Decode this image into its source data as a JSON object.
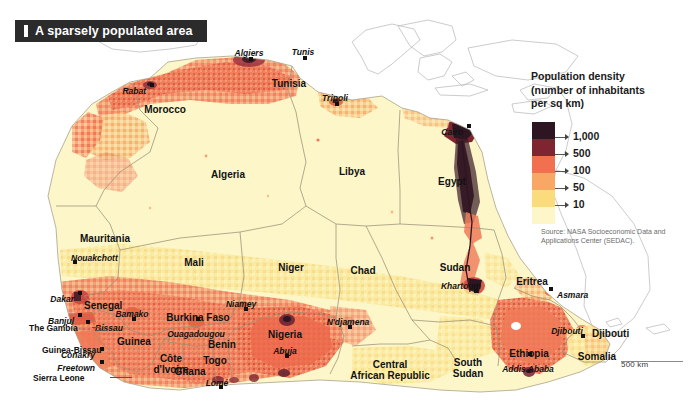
{
  "title": {
    "text": "A sparsely populated area",
    "marker": "bar-marker"
  },
  "legend": {
    "title_lines": [
      "Population density",
      "(number of inhabitants",
      "per sq km)"
    ],
    "classes": [
      {
        "label": "1,000",
        "color": "#2d1622"
      },
      {
        "label": "500",
        "color": "#7e2531"
      },
      {
        "label": "100",
        "color": "#f07050"
      },
      {
        "label": "50",
        "color": "#f8a765"
      },
      {
        "label": "10",
        "color": "#fadc7e"
      }
    ],
    "lowest_color": "#fcf6c8"
  },
  "source": "Source: NASA Socioeconomic Data and Applications Center (SEDAC).",
  "scale": {
    "label": "500 km"
  },
  "countries": [
    {
      "name": "Morocco",
      "x": 165,
      "y": 104,
      "align": "ctr"
    },
    {
      "name": "Tunisia",
      "x": 289,
      "y": 78,
      "align": "ctr"
    },
    {
      "name": "Algeria",
      "x": 228,
      "y": 169,
      "align": "ctr"
    },
    {
      "name": "Libya",
      "x": 352,
      "y": 166,
      "align": "ctr"
    },
    {
      "name": "Egypt",
      "x": 452,
      "y": 176,
      "align": "ctr"
    },
    {
      "name": "Mauritania",
      "x": 105,
      "y": 233,
      "align": "ctr"
    },
    {
      "name": "Mali",
      "x": 194,
      "y": 257,
      "align": "ctr"
    },
    {
      "name": "Niger",
      "x": 291,
      "y": 262,
      "align": "ctr"
    },
    {
      "name": "Chad",
      "x": 363,
      "y": 265,
      "align": "ctr"
    },
    {
      "name": "Sudan",
      "x": 455,
      "y": 262,
      "align": "ctr"
    },
    {
      "name": "Senegal",
      "x": 84,
      "y": 300,
      "align": "lft"
    },
    {
      "name": "Guinea",
      "x": 117,
      "y": 336,
      "align": "lft"
    },
    {
      "name": "Burkina Faso",
      "x": 198,
      "y": 312,
      "align": "ctr"
    },
    {
      "name": "Nigeria",
      "x": 285,
      "y": 329,
      "align": "ctr"
    },
    {
      "name": "Benin",
      "x": 222,
      "y": 339,
      "align": "ctr"
    },
    {
      "name": "Togo",
      "x": 215,
      "y": 355,
      "align": "ctr"
    },
    {
      "name": "Ghana",
      "x": 190,
      "y": 366,
      "align": "ctr"
    },
    {
      "name": "Ethiopia",
      "x": 529,
      "y": 348,
      "align": "ctr"
    },
    {
      "name": "Somalia",
      "x": 597,
      "y": 351,
      "align": "ctr"
    },
    {
      "name": "Eritrea",
      "x": 532,
      "y": 276,
      "align": "ctr"
    },
    {
      "name": "Djibouti",
      "x": 592,
      "y": 328,
      "align": "lft"
    }
  ],
  "countries_multiline": [
    {
      "lines": [
        "Guinea-Bissau"
      ],
      "x": 42,
      "y": 345,
      "align": "lft",
      "size": "sm"
    },
    {
      "lines": [
        "The Gambia"
      ],
      "x": 29,
      "y": 323,
      "align": "lft",
      "size": "sm"
    },
    {
      "lines": [
        "Sierra Leone"
      ],
      "x": 33,
      "y": 373,
      "align": "lft",
      "size": "sm"
    },
    {
      "lines": [
        "Côte",
        "d'Ivoire"
      ],
      "x": 171,
      "y": 354,
      "align": "ctr",
      "size": "country"
    },
    {
      "lines": [
        "Central",
        "African Republic"
      ],
      "x": 390,
      "y": 360,
      "align": "ctr",
      "size": "country"
    },
    {
      "lines": [
        "South",
        "Sudan"
      ],
      "x": 468,
      "y": 358,
      "align": "ctr",
      "size": "country"
    }
  ],
  "cities": [
    {
      "name": "Algiers",
      "x": 249,
      "y": 48,
      "align": "ctr",
      "dot_dx": 0,
      "dot_dy": 9
    },
    {
      "name": "Tunis",
      "x": 303,
      "y": 47,
      "align": "ctr",
      "dot_dx": 0,
      "dot_dy": 9
    },
    {
      "name": "Rabat",
      "x": 146,
      "y": 86,
      "align": "rt",
      "dot_dx": 4,
      "dot_dy": -3
    },
    {
      "name": "Tripoli",
      "x": 335,
      "y": 93,
      "align": "ctr",
      "dot_dx": 0,
      "dot_dy": 9
    },
    {
      "name": "Cairo",
      "x": 463,
      "y": 127,
      "align": "rt",
      "dot_dx": 4,
      "dot_dy": -3
    },
    {
      "name": "Nouakchott",
      "x": 71,
      "y": 253,
      "align": "lft",
      "dot_dx": 2,
      "dot_dy": 7
    },
    {
      "name": "Dakar",
      "x": 74,
      "y": 294,
      "align": "rt",
      "dot_dx": 4,
      "dot_dy": -3
    },
    {
      "name": "Banjul",
      "x": 74,
      "y": 316,
      "align": "rt",
      "dot_dx": 4,
      "dot_dy": -3
    },
    {
      "name": "Bissau",
      "x": 95,
      "y": 323,
      "align": "lft",
      "dot_dx": -9,
      "dot_dy": -3
    },
    {
      "name": "Conakry",
      "x": 95,
      "y": 350,
      "align": "rt",
      "dot_dx": 5,
      "dot_dy": -3
    },
    {
      "name": "Freetown",
      "x": 95,
      "y": 363,
      "align": "rt",
      "dot_dx": 5,
      "dot_dy": -3
    },
    {
      "name": "Bamako",
      "x": 132,
      "y": 309,
      "align": "ctr",
      "dot_dx": 0,
      "dot_dy": 8
    },
    {
      "name": "Ouagadougou",
      "x": 196,
      "y": 329,
      "align": "ctr",
      "dot_dx": 0,
      "dot_dy": -12
    },
    {
      "name": "Niamey",
      "x": 241,
      "y": 299,
      "align": "ctr",
      "dot_dx": 3,
      "dot_dy": 8
    },
    {
      "name": "Abuja",
      "x": 285,
      "y": 346,
      "align": "ctr",
      "dot_dx": 0,
      "dot_dy": 8
    },
    {
      "name": "Lomé",
      "x": 217,
      "y": 378,
      "align": "ctr",
      "dot_dx": 2,
      "dot_dy": 7
    },
    {
      "name": "N'djamena",
      "x": 348,
      "y": 317,
      "align": "ctr",
      "dot_dx": 0,
      "dot_dy": 8
    },
    {
      "name": "Khartoum",
      "x": 461,
      "y": 281,
      "align": "ctr",
      "dot_dx": 13,
      "dot_dy": 8
    },
    {
      "name": "Asmara",
      "x": 557,
      "y": 290,
      "align": "lft",
      "dot_dx": -8,
      "dot_dy": -3
    },
    {
      "name": "Djibouti",
      "x": 567,
      "y": 326,
      "align": "ctr",
      "dot_dx": 14,
      "dot_dy": 8
    },
    {
      "name": "Addis Ababa",
      "x": 528,
      "y": 364,
      "align": "ctr",
      "dot_dx": 0,
      "dot_dy": -12
    }
  ],
  "chart_data": {
    "type": "heatmap",
    "title": "A sparsely populated area",
    "unit": "inhabitants per sq km",
    "legend_breaks": [
      10,
      50,
      100,
      500,
      1000
    ],
    "legend_colors": [
      "#fadc7e",
      "#f8a765",
      "#f07050",
      "#7e2531",
      "#2d1622"
    ],
    "source": "NASA Socioeconomic Data and Applications Center (SEDAC)",
    "scale_bar_km": 500,
    "notes": [
      "Most of the Sahara (Algeria, Libya, Mauritania, Mali, Niger, Chad) is in the lowest density class (under 10 per sq km).",
      "Highest densities appear along the Nile delta and valley around Cairo (over 1,000 per sq km).",
      "Dense bands also follow the Mediterranean coast of Morocco, Algeria and Tunisia.",
      "Southern Nigeria, the Ethiopian highlands and the West African coast show 100-1,000 per sq km."
    ]
  }
}
